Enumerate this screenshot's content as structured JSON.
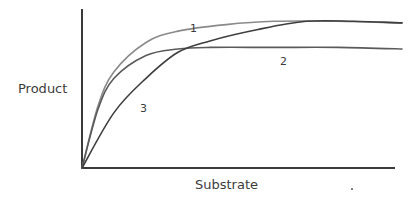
{
  "chart_data": {
    "type": "line",
    "title": "",
    "xlabel": "Substrate",
    "ylabel": "Product",
    "grid": false,
    "ticks": false,
    "legend": "inline curve labels",
    "xlim": [
      0,
      1
    ],
    "ylim": [
      0,
      1
    ],
    "series": [
      {
        "name": "1",
        "color": "#8a8a8a",
        "points": [
          [
            0,
            0
          ],
          [
            0.05,
            0.38
          ],
          [
            0.1,
            0.59
          ],
          [
            0.2,
            0.77
          ],
          [
            0.3,
            0.84
          ],
          [
            0.45,
            0.88
          ],
          [
            0.6,
            0.9
          ],
          [
            0.8,
            0.9
          ],
          [
            1.0,
            0.89
          ]
        ]
      },
      {
        "name": "2",
        "color": "#5a5a5a",
        "points": [
          [
            0,
            0
          ],
          [
            0.05,
            0.36
          ],
          [
            0.1,
            0.55
          ],
          [
            0.2,
            0.69
          ],
          [
            0.3,
            0.73
          ],
          [
            0.4,
            0.74
          ],
          [
            0.6,
            0.74
          ],
          [
            0.8,
            0.74
          ],
          [
            1.0,
            0.73
          ]
        ]
      },
      {
        "name": "3",
        "color": "#3e3e3e",
        "points": [
          [
            0,
            0
          ],
          [
            0.1,
            0.34
          ],
          [
            0.2,
            0.55
          ],
          [
            0.3,
            0.71
          ],
          [
            0.4,
            0.78
          ],
          [
            0.55,
            0.85
          ],
          [
            0.7,
            0.9
          ],
          [
            0.85,
            0.9
          ],
          [
            1.0,
            0.89
          ]
        ]
      }
    ],
    "annotations": [
      {
        "text": "1",
        "near": "curve 1, upper"
      },
      {
        "text": "2",
        "near": "curve 2 plateau"
      },
      {
        "text": "3",
        "near": "curve 3, rising section"
      }
    ]
  },
  "labels": {
    "y_axis": "Product",
    "x_axis": "Substrate",
    "curve1": "1",
    "curve2": "2",
    "curve3": "3"
  }
}
